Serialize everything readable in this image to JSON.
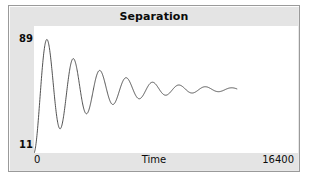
{
  "widget": {
    "title": "Separation"
  },
  "axes": {
    "y_max_label": "89",
    "y_min_label": "11",
    "x_min_label": "0",
    "x_max_label": "16400",
    "x_axis_name": "Time"
  },
  "colors": {
    "panel_background": "#e4e4e4",
    "plot_background": "#ffffff",
    "curve": "#3c3c3c",
    "border": "#9a9a9a",
    "text": "#0b0b0b"
  },
  "chart_data": {
    "type": "line",
    "title": "Separation",
    "xlabel": "Time",
    "ylabel": "",
    "xlim": [
      0,
      16400
    ],
    "ylim": [
      11,
      89
    ],
    "grid": false,
    "legend": null,
    "model": {
      "form": "y = baseline + amplitude * exp(-t/tau) * cos(2*pi*t/period + phase)",
      "baseline": 50,
      "amplitude": 39,
      "period": 1640,
      "tau": 3400,
      "phase_degrees": 180,
      "t_start": 0,
      "t_end": 12600
    },
    "x": [
      0,
      205,
      410,
      615,
      820,
      1025,
      1230,
      1435,
      1640,
      1845,
      2050,
      2255,
      2460,
      2665,
      2870,
      3075,
      3280,
      3485,
      3690,
      3895,
      4100,
      4305,
      4510,
      4715,
      4920,
      5125,
      5330,
      5535,
      5740,
      5945,
      6150,
      6355,
      6560,
      6765,
      6970,
      7175,
      7380,
      7585,
      7790,
      7995,
      8200,
      8405,
      8610,
      8815,
      9020,
      9225,
      9430,
      9635,
      9840,
      10045,
      10250,
      10455,
      10660,
      10865,
      11070,
      11275,
      11480,
      11685,
      11890,
      12095,
      12300,
      12600
    ],
    "y": [
      11.0,
      13.9,
      22.3,
      34.8,
      49.1,
      62.5,
      72.9,
      79.0,
      80.7,
      78.2,
      72.0,
      63.2,
      53.1,
      43.2,
      34.8,
      28.9,
      26.0,
      26.3,
      29.6,
      35.4,
      42.6,
      50.2,
      57.3,
      62.9,
      66.5,
      67.6,
      66.4,
      63.0,
      58.2,
      52.6,
      47.1,
      42.3,
      38.8,
      36.9,
      36.6,
      38.0,
      40.7,
      44.3,
      48.3,
      52.2,
      55.5,
      57.8,
      59.0,
      58.9,
      57.7,
      55.7,
      53.1,
      50.3,
      47.7,
      45.6,
      44.1,
      43.5,
      43.6,
      44.5,
      45.9,
      47.6,
      49.4,
      51.1,
      52.4,
      53.2,
      53.5,
      50.0
    ]
  }
}
